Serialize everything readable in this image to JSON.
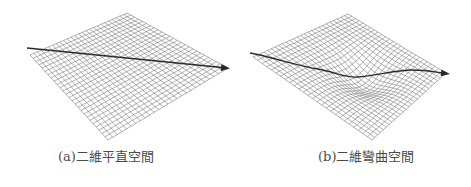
{
  "figure": {
    "panels": [
      {
        "id": "a",
        "caption": "(a)二維平直空間",
        "description": "flat 2D grid surface with straight arrow path",
        "surface": "flat",
        "grid_divisions": 26
      },
      {
        "id": "b",
        "caption": "(b)二維彎曲空間",
        "description": "curved 2D grid surface with central depression and curved arrow path",
        "surface": "curved",
        "grid_divisions": 26
      }
    ],
    "colors": {
      "grid_line": "#7a7a7a",
      "arrow": "#2a2a2a",
      "caption_text": "#4a4a4a",
      "background": "#ffffff"
    }
  }
}
